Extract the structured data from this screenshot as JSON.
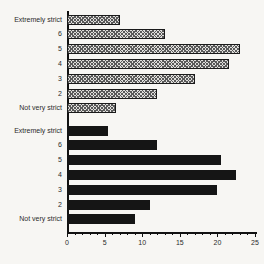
{
  "chart_data": {
    "type": "bar",
    "orientation": "horizontal",
    "title": "",
    "xlabel": "",
    "ylabel": "",
    "categories": [
      "Extremely strict",
      "6",
      "5",
      "4",
      "3",
      "2",
      "Not very strict"
    ],
    "series": [
      {
        "name": "top-hatched-group",
        "style": "hatched",
        "values": [
          7,
          13,
          23,
          21.5,
          17,
          12,
          6.5
        ]
      },
      {
        "name": "bottom-solid-group",
        "style": "solid",
        "values": [
          5.5,
          12,
          20.5,
          22.5,
          20,
          11,
          9
        ]
      }
    ],
    "xlim": [
      0,
      25
    ],
    "x_ticks": [
      0,
      5,
      10,
      15,
      20,
      25
    ],
    "minor_tick_step": 1,
    "legend": "none",
    "grid": false,
    "colors": {
      "solid_bar": "#151515",
      "hatch_line": "#5a5a5a",
      "hatch_background": "#e0dfdc",
      "bar_outline": "#1a1a1a",
      "axis": "#111111",
      "background": "#f7f6f3",
      "label_text": "#2b2b2b"
    }
  }
}
